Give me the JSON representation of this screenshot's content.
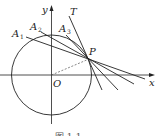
{
  "diagram": {
    "type": "geometry",
    "labels": {
      "y_axis": "y",
      "x_axis": "x",
      "origin": "O",
      "point_p": "P",
      "tangent": "T",
      "a1": "A",
      "a1_sub": "1",
      "a2": "A",
      "a2_sub": "2",
      "a3": "A",
      "a3_sub": "3"
    },
    "caption": "图 1-1",
    "colors": {
      "stroke": "#222222",
      "dashed": "#555555",
      "background": "#ffffff"
    }
  }
}
